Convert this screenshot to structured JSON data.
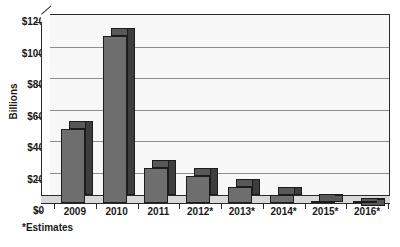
{
  "chart_data": {
    "type": "bar",
    "title": "",
    "subtitle": "",
    "xlabel": "",
    "ylabel": "Billions",
    "categories": [
      "2009",
      "2010",
      "2011",
      "2012*",
      "2013*",
      "2014*",
      "2015*",
      "2016*"
    ],
    "values": [
      52,
      111,
      27,
      22,
      15,
      10,
      6,
      3
    ],
    "series": [
      {
        "name": "Billions",
        "values": [
          52,
          111,
          27,
          22,
          15,
          10,
          6,
          3
        ]
      }
    ],
    "ylim": [
      0,
      120
    ],
    "ytick_values": [
      0,
      20,
      40,
      60,
      80,
      100,
      120
    ],
    "ytick_labels": [
      "$0",
      "$20",
      "$40",
      "$60",
      "$80",
      "$100",
      "$120"
    ],
    "grid": true,
    "legend": false,
    "legend_position": "none",
    "three_d": true,
    "annotations": [
      "*Estimates"
    ],
    "colors": {
      "bar_face": "#6e6e6e",
      "bar_side": "#3d3d3d",
      "bar_top": "#585858",
      "bar_outline": "#1c1c1c",
      "plot_background": "#f7f7f7",
      "gridline": "#8d8d8d",
      "axis": "#2b2b2b",
      "floor": "#d8d8d8",
      "text": "#1a1a1a",
      "page_background": "#ffffff"
    }
  },
  "footnote": {
    "text": "*Estimates"
  }
}
